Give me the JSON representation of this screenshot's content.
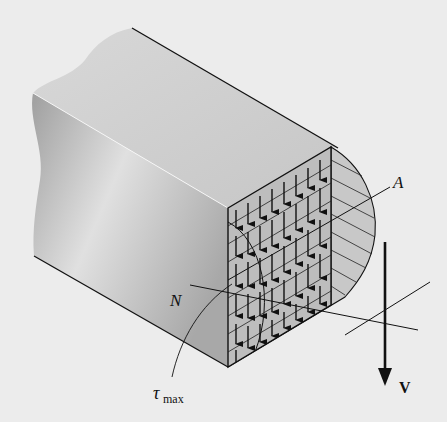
{
  "figure": {
    "labels": {
      "point_a": "A",
      "neutral_axis": "N",
      "tau_symbol": "τ",
      "tau_subscript": "max",
      "shear_force": "V"
    },
    "colors": {
      "background": "#ececec",
      "beam_top": "#d2d2d2",
      "beam_side_light": "#e2e2e2",
      "beam_side_dark": "#a9a9a9",
      "section_fill": "#bdbdbd",
      "distribution_fill": "#c8c8c8",
      "line": "#111111"
    }
  }
}
